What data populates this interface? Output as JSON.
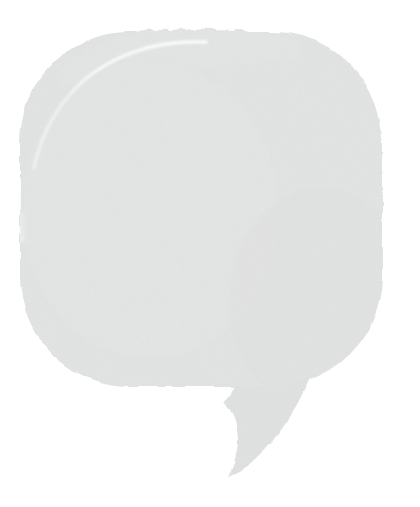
{
  "canvas": {
    "width": 420,
    "height": 507,
    "background_color": "#ffffff",
    "alt_text": "Speech bubble"
  },
  "graphic": {
    "name": "speech-bubble",
    "shape": "rounded-square-speech-bubble",
    "fill_color": "#e3e4e4",
    "fill_color_secondary": "#e0e1e1",
    "highlight_color": "#f5f6f6",
    "seam_color": "#eceded",
    "edge_style": "ragged",
    "texture": "subtle-paper-noise",
    "body": {
      "left": 18,
      "top": 32,
      "right": 382,
      "bottom": 386,
      "corner_radius": 112
    },
    "tail": {
      "direction": "down-left",
      "tip_x": 228,
      "tip_y": 476,
      "attach_left_x": 232,
      "attach_right_x": 312,
      "attach_y": 372
    },
    "details": [
      {
        "name": "top-left-highlight-arc",
        "color": "#fbfbfb",
        "start_x": 38,
        "start_y": 160,
        "end_x": 205,
        "end_y": 46
      },
      {
        "name": "vertical-seam-line",
        "color": "#ecedec",
        "x": 320,
        "from_y": 52,
        "to_y": 352
      },
      {
        "name": "left-edge-notch",
        "x": 19,
        "y": 213,
        "width": 6,
        "height": 28
      }
    ]
  },
  "caption": {
    "label": "",
    "placeholder": ""
  }
}
